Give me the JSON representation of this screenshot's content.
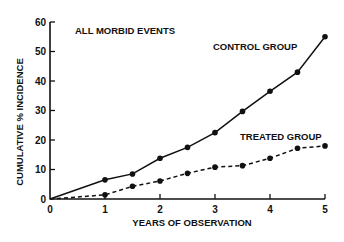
{
  "chart_data": {
    "type": "line",
    "title": "",
    "annotations": [
      "ALL MORBID EVENTS"
    ],
    "xlabel": "YEARS OF OBSERVATION",
    "ylabel": "CUMULATIVE % INCIDENCE",
    "xlim": [
      0,
      5
    ],
    "ylim": [
      0,
      60
    ],
    "xticks": [
      0,
      1,
      2,
      3,
      4,
      5
    ],
    "xtick_labels": [
      "0",
      "1",
      "2",
      "3",
      "4",
      "5"
    ],
    "yticks": [
      0,
      10,
      20,
      30,
      40,
      50,
      60
    ],
    "ytick_labels": [
      "0",
      "10",
      "20",
      "30",
      "40",
      "50",
      "60"
    ],
    "grid": false,
    "legend": "inline labels",
    "series": [
      {
        "name": "CONTROL GROUP",
        "style": "solid",
        "x": [
          0,
          1,
          1.5,
          2,
          2.5,
          3,
          3.5,
          4,
          4.5,
          5
        ],
        "values": [
          0,
          6.5,
          8.5,
          13.8,
          17.5,
          22.5,
          29.7,
          36.5,
          43,
          55
        ]
      },
      {
        "name": "TREATED GROUP",
        "style": "dashed",
        "x": [
          0,
          1,
          1.5,
          2,
          2.5,
          3,
          3.5,
          4,
          4.5,
          5
        ],
        "values": [
          0,
          1.4,
          4.3,
          6.1,
          8.7,
          10.8,
          11.3,
          13.8,
          17.2,
          18
        ]
      }
    ],
    "colors": {
      "line": "#111111",
      "background": "#ffffff"
    }
  }
}
